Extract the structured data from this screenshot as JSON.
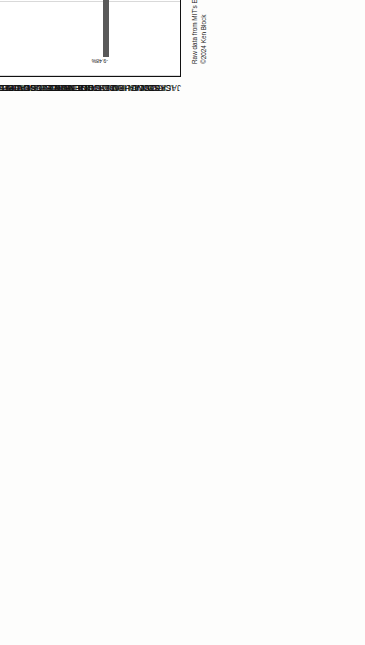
{
  "chart_data": {
    "type": "bar",
    "orientation": "horizontal",
    "title": "Margin",
    "subtitle": "Trump's change in the percentage of the vote from 2016 to 2020",
    "xlabel": "Margin",
    "ylabel": "",
    "xlim": [
      -10.0,
      4.0
    ],
    "xticks": [
      "-10.00%",
      "-8.00%",
      "-6.00%",
      "-4.00%",
      "-2.00%",
      "0.00%",
      "2.00%",
      "4.00%"
    ],
    "xtick_values": [
      -10,
      -8,
      -6,
      -4,
      -2,
      0,
      2,
      4
    ],
    "grid": true,
    "legend": "none",
    "bar_color": "#595959",
    "highlight_color": "#e9e9e9",
    "highlight_category": "INGHAM",
    "categories": [
      "ALCONA",
      "ALGER",
      "ALLEGAN",
      "ALPENA",
      "ANTRIM",
      "ARENAC",
      "BARAGA",
      "BARRY",
      "BAY",
      "BENZIE",
      "BERREN",
      "BRANCH",
      "CALHOUN",
      "CASS",
      "CHARLEVOIX",
      "CHEBOYGAN",
      "CHIPPEWA",
      "CLARE",
      "CLINTON",
      "CRAWFORD",
      "DELTA",
      "DICKINSON",
      "EATON",
      "EMMET",
      "GENESEE",
      "GLADWIN",
      "GOGEBIC",
      "GRAND TRAVERESE",
      "GRATIOT",
      "HILLSDALE",
      "HOUGHTON",
      "HURON",
      "INGHAM",
      "IONIA",
      "IOSCO",
      "IRON",
      "ISABELLA",
      "JACKSON"
    ],
    "values": [
      -1.52,
      -1.01,
      -3.17,
      -0.69,
      -6.45,
      2.23,
      -2.23,
      -1.46,
      -0.86,
      -4.05,
      -5.3,
      -0.45,
      -1.55,
      -0.96,
      -5.23,
      -2.23,
      -1.41,
      2.53,
      -4.53,
      -2.52,
      -0.35,
      -1.59,
      -2.75,
      -6.29,
      -0.23,
      -2.05,
      -2.69,
      -9.48,
      1.29,
      -1.35,
      -1.62,
      -0.67,
      -3.48,
      -0.89,
      1.41,
      -2.03,
      -1.05,
      -0.51
    ],
    "value_labels": [
      "-1.52%",
      "-1.01%",
      "-3.17%",
      "-0.69%",
      "-6.45%",
      "2.23%",
      "-2.23%",
      "-1.46%",
      "-0.86%",
      "-4.05%",
      "-5.30%",
      "-0.45%",
      "-1.55%",
      "-0.96%",
      "-5.23%",
      "-2.23%",
      "-1.41%",
      "2.53%",
      "-4.53%",
      "-2.52%",
      "-0.35%",
      "-1.59%",
      "-2.75%",
      "-6.29%",
      "-0.23%",
      "-2.05%",
      "-2.69%",
      "-9.48%",
      "1.29%",
      "-1.35%",
      "-1.62%",
      "-0.67%",
      "-3.48%",
      "-0.89%",
      "1.41%",
      "-2.03%",
      "-1.05%",
      "-0.51%"
    ]
  },
  "credit": {
    "line1": "Raw data from MIT's Election Data and Science Laboratory. https://doi.org/10.7910/DVN/VOOCHQ",
    "line2": "©2024 Ken Block"
  }
}
